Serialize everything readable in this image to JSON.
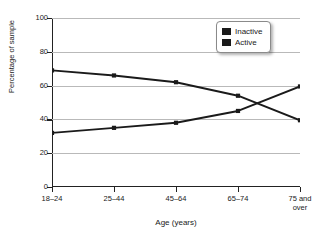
{
  "chart_data": {
    "type": "line",
    "title": "",
    "xlabel": "Age (years)",
    "ylabel": "Percentage of sample",
    "categories": [
      "18–24",
      "25–44",
      "45–64",
      "65–74",
      "75 and\nover"
    ],
    "ylim": [
      0,
      100
    ],
    "yticks": [
      0,
      20,
      40,
      60,
      80,
      100
    ],
    "ytick_labels": [
      "0",
      "20",
      "40",
      "60",
      "80",
      "100"
    ],
    "grid": "horizontal",
    "legend_position": "top-right",
    "series": [
      {
        "name": "Inactive",
        "color": "#1a1a1a",
        "marker": "square",
        "values": [
          69,
          66,
          62,
          54,
          39.5
        ]
      },
      {
        "name": "Active",
        "color": "#1a1a1a",
        "marker": "square",
        "values": [
          32,
          35,
          38,
          45,
          59.5
        ]
      }
    ]
  },
  "legend": {
    "items": [
      {
        "label": "Inactive",
        "swatch_color": "#1a1a1a"
      },
      {
        "label": "Active",
        "swatch_color": "#1a1a1a"
      }
    ]
  },
  "axes": {
    "y_title": "Percentage of sample",
    "x_title": "Age (years)",
    "axis_color": "#222222",
    "grid_color": "#b9b9b9"
  }
}
